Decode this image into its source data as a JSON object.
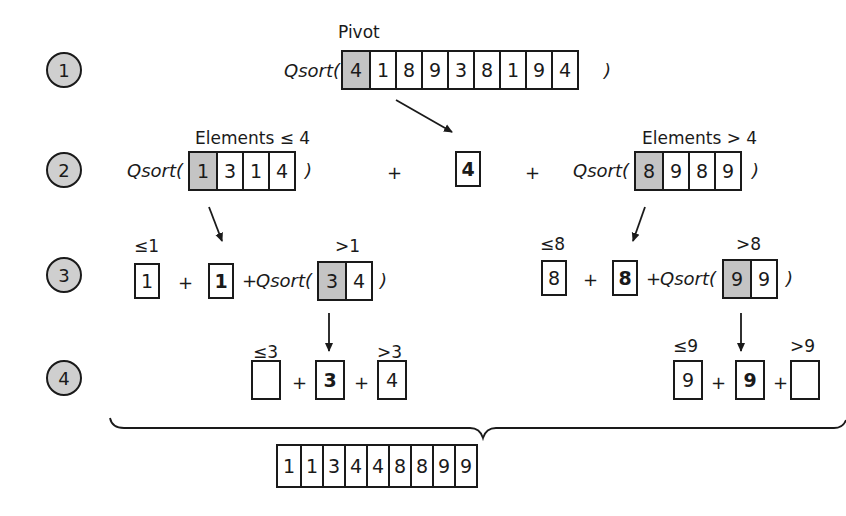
{
  "diagram": {
    "steps": [
      "1",
      "2",
      "3",
      "4"
    ],
    "function_name": "Qsort(",
    "close_paren": ")",
    "plus": "+",
    "row1": {
      "pivot_label": "Pivot",
      "array": [
        "4",
        "1",
        "8",
        "9",
        "3",
        "8",
        "1",
        "9",
        "4"
      ],
      "pivot_index": 0
    },
    "row2": {
      "left_label": "Elements ≤ 4",
      "left_array": [
        "1",
        "3",
        "1",
        "4"
      ],
      "pivot": "4",
      "right_label": "Elements > 4",
      "right_array": [
        "8",
        "9",
        "8",
        "9"
      ]
    },
    "row3": {
      "left": {
        "le_label": "≤1",
        "le_box": "1",
        "pivot": "1",
        "gt_label": ">1",
        "gt_array": [
          "3",
          "4"
        ]
      },
      "right": {
        "le_label": "≤8",
        "le_box": "8",
        "pivot": "8",
        "gt_label": ">8",
        "gt_array": [
          "9",
          "9"
        ]
      }
    },
    "row4": {
      "left": {
        "le_label": "≤3",
        "le_box": "",
        "pivot": "3",
        "gt_label": ">3",
        "gt_box": "4"
      },
      "right": {
        "le_label": "≤9",
        "le_box": "9",
        "pivot": "9",
        "gt_label": ">9",
        "gt_box": ""
      }
    },
    "result": [
      "1",
      "1",
      "3",
      "4",
      "4",
      "8",
      "8",
      "9",
      "9"
    ],
    "colors": {
      "pivot_fill": "#c4c4c4",
      "step_fill": "#cfcfcf",
      "stroke": "#1a1a1a"
    }
  }
}
